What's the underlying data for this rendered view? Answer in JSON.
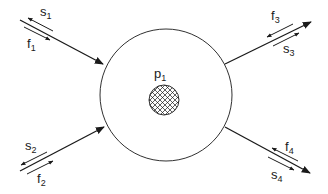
{
  "diagram": {
    "node": {
      "label": "p",
      "subscript": "1",
      "outer_circle": {
        "cx": 166,
        "cy": 95,
        "r": 67
      },
      "inner_circle": {
        "cx": 164,
        "cy": 100,
        "r": 15,
        "fill": "crosshatch"
      }
    },
    "ports": [
      {
        "id": 1,
        "direction": "in",
        "main_label": "s",
        "main_sub": "1",
        "other_label": "f",
        "other_sub": "1"
      },
      {
        "id": 2,
        "direction": "in",
        "main_label": "s",
        "main_sub": "2",
        "other_label": "f",
        "other_sub": "2"
      },
      {
        "id": 3,
        "direction": "out",
        "main_label": "f",
        "main_sub": "3",
        "other_label": "s",
        "other_sub": "3"
      },
      {
        "id": 4,
        "direction": "out",
        "main_label": "f",
        "main_sub": "4",
        "other_label": "s",
        "other_sub": "4"
      }
    ],
    "colors": {
      "stroke": "#1a1a1a",
      "background": "#ffffff"
    }
  }
}
